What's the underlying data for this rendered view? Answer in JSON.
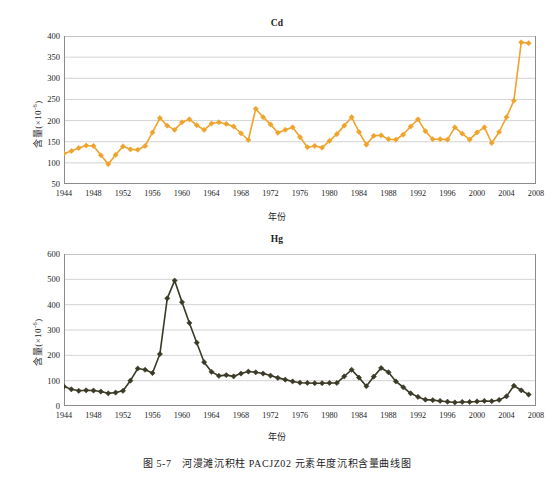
{
  "figure": {
    "caption": "图 5-7　河漫滩沉积柱 PACJZ02 元素年度沉积含量曲线图",
    "background_color": "#ffffff",
    "axis_color": "#8c8c8c",
    "grid_color": "#c8c8c8",
    "text_color": "#1d1d1d"
  },
  "chart_data": [
    {
      "type": "line",
      "id": "cd",
      "title": "Cd",
      "xlabel": "年份",
      "ylabel": "含量(×10⁻⁶)",
      "ylabel_base": "含量(×10",
      "ylabel_exp": "-6",
      "ylabel_tail": ")",
      "series_color": "#EFA32B",
      "marker": "diamond",
      "grid": true,
      "legend": "none",
      "xlim": [
        1944,
        2008
      ],
      "ylim": [
        50,
        400
      ],
      "ytick_step": 50,
      "yticks": [
        50,
        100,
        150,
        200,
        250,
        300,
        350,
        400
      ],
      "xticks": [
        1944,
        1948,
        1952,
        1956,
        1960,
        1964,
        1968,
        1972,
        1976,
        1980,
        1984,
        1988,
        1992,
        1996,
        2000,
        2004,
        2008
      ],
      "x": [
        1944,
        1945,
        1946,
        1947,
        1948,
        1949,
        1950,
        1951,
        1952,
        1953,
        1954,
        1955,
        1956,
        1957,
        1958,
        1959,
        1960,
        1961,
        1962,
        1963,
        1964,
        1965,
        1966,
        1967,
        1968,
        1969,
        1970,
        1971,
        1972,
        1973,
        1974,
        1975,
        1976,
        1977,
        1978,
        1979,
        1980,
        1981,
        1982,
        1983,
        1984,
        1985,
        1986,
        1987,
        1988,
        1989,
        1990,
        1991,
        1992,
        1993,
        1994,
        1995,
        1996,
        1997,
        1998,
        1999,
        2000,
        2001,
        2002,
        2003,
        2004,
        2005,
        2006,
        2007
      ],
      "values": [
        122,
        128,
        135,
        141,
        140,
        118,
        97,
        119,
        139,
        132,
        131,
        140,
        172,
        206,
        188,
        178,
        196,
        203,
        189,
        178,
        193,
        196,
        192,
        186,
        170,
        154,
        228,
        208,
        191,
        171,
        178,
        184,
        161,
        137,
        140,
        136,
        152,
        168,
        188,
        208,
        173,
        143,
        164,
        165,
        156,
        155,
        167,
        186,
        203,
        175,
        156,
        156,
        155,
        184,
        169,
        155,
        172,
        184,
        147,
        173,
        208,
        247,
        385,
        383
      ]
    },
    {
      "type": "line",
      "id": "hg",
      "title": "Hg",
      "xlabel": "年份",
      "ylabel": "含量(×10⁻⁶)",
      "ylabel_base": "含量(×10",
      "ylabel_exp": "-6",
      "ylabel_tail": ")",
      "series_color": "#3A3A26",
      "marker": "diamond",
      "grid": true,
      "legend": "none",
      "xlim": [
        1944,
        2008
      ],
      "ylim": [
        0,
        600
      ],
      "ytick_step": 100,
      "yticks": [
        0,
        100,
        200,
        300,
        400,
        500,
        600
      ],
      "xticks": [
        1944,
        1948,
        1952,
        1956,
        1960,
        1964,
        1968,
        1972,
        1976,
        1980,
        1984,
        1988,
        1992,
        1996,
        2000,
        2004,
        2008
      ],
      "x": [
        1944,
        1945,
        1946,
        1947,
        1948,
        1949,
        1950,
        1951,
        1952,
        1953,
        1954,
        1955,
        1956,
        1957,
        1958,
        1959,
        1960,
        1961,
        1962,
        1963,
        1964,
        1965,
        1966,
        1967,
        1968,
        1969,
        1970,
        1971,
        1972,
        1973,
        1974,
        1975,
        1976,
        1977,
        1978,
        1979,
        1980,
        1981,
        1982,
        1983,
        1984,
        1985,
        1986,
        1987,
        1988,
        1989,
        1990,
        1991,
        1992,
        1993,
        1994,
        1995,
        1996,
        1997,
        1998,
        1999,
        2000,
        2001,
        2002,
        2003,
        2004,
        2005,
        2006,
        2007
      ],
      "values": [
        77,
        66,
        60,
        62,
        61,
        57,
        50,
        53,
        60,
        100,
        148,
        143,
        130,
        205,
        425,
        495,
        410,
        328,
        250,
        173,
        135,
        119,
        122,
        117,
        128,
        136,
        133,
        128,
        120,
        111,
        104,
        97,
        92,
        91,
        90,
        90,
        91,
        91,
        117,
        143,
        112,
        78,
        116,
        150,
        133,
        97,
        74,
        50,
        36,
        25,
        23,
        20,
        17,
        14,
        16,
        16,
        18,
        20,
        19,
        24,
        38,
        80,
        62,
        45,
        31,
        35,
        58,
        85
      ]
    }
  ]
}
